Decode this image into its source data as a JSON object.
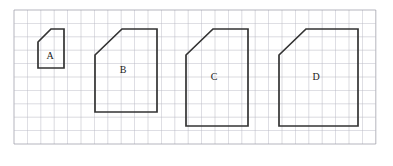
{
  "figure": {
    "background_color": "#ffffff",
    "width": 393,
    "height": 166
  },
  "grid": {
    "name": "graph-paper-grid",
    "cell_size": 13.4,
    "origin_x": 14,
    "origin_y": 10,
    "columns": 27,
    "rows": 10,
    "line_color": "#b9b9c4",
    "border_color": "#9a9aa6",
    "visible": true
  },
  "shapes": [
    {
      "id": "shape-a",
      "label": "A",
      "stroke_color": "#333333",
      "label_x": 50,
      "label_y": 57,
      "points": "38,42 51,29 64,29 64,68 38,68",
      "grid_units": {
        "width": 2,
        "height": 3,
        "cut": 1
      }
    },
    {
      "id": "shape-b",
      "label": "B",
      "stroke_color": "#333333",
      "label_x": 123,
      "label_y": 71,
      "points": "95,55 122,29 157,29 157,112 95,112",
      "grid_units": {
        "width": 4.6,
        "height": 6.2,
        "cut": 2
      }
    },
    {
      "id": "shape-c",
      "label": "C",
      "stroke_color": "#333333",
      "label_x": 214,
      "label_y": 78,
      "points": "186,55 213,29 248,29 248,126 186,126",
      "grid_units": {
        "width": 4.6,
        "height": 7.2,
        "cut": 2
      }
    },
    {
      "id": "shape-d",
      "label": "D",
      "stroke_color": "#333333",
      "label_x": 316,
      "label_y": 78,
      "points": "279,55 306,29 358,29 358,126 279,126",
      "grid_units": {
        "width": 5.9,
        "height": 7.2,
        "cut": 2
      }
    }
  ]
}
